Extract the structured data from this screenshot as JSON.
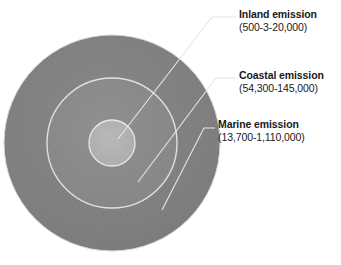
{
  "chart_data": {
    "type": "pie",
    "title": "",
    "subtitle": "",
    "xlabel": "",
    "ylabel": "",
    "legend_position": "right",
    "grid": false,
    "layout": "concentric-circles",
    "categories": [
      "Inland emission",
      "Coastal emission",
      "Marine emission"
    ],
    "annotations": [
      "Inland emission (500-3-20,000)",
      "Coastal emission (54,300-145,000)",
      "Marine emission (13,700-1,110,000)"
    ],
    "series": [
      {
        "name": "emission range",
        "values": [
          {
            "category": "Inland emission",
            "range_text": "(500-3-20,000)",
            "low": 500,
            "high": 20000,
            "radius_px": 23
          },
          {
            "category": "Coastal emission",
            "range_text": "(54,300-145,000)",
            "low": 54300,
            "high": 145000,
            "radius_px": 65
          },
          {
            "category": "Marine emission",
            "range_text": "(13,700-1,110,000)",
            "low": 13700,
            "high": 1110000,
            "radius_px": 108
          }
        ]
      }
    ]
  },
  "figure": {
    "center": {
      "x": 112,
      "y": 143
    },
    "rings": [
      {
        "id": "marine",
        "name": "Marine emission",
        "radius": 108,
        "fill": "#7f7f7f",
        "stroke": "#d9d9d9"
      },
      {
        "id": "coastal",
        "name": "Coastal emission",
        "radius": 65,
        "fill": "#878787",
        "stroke": "#e0e0e0"
      },
      {
        "id": "inland",
        "name": "Inland emission",
        "radius": 23,
        "fill": "#b0b0b0",
        "stroke": "#e8e8e8"
      }
    ],
    "leader_line_color": "#e6e6e6"
  },
  "labels": {
    "inland": {
      "title": "Inland emission",
      "range": "(500-3-20,000)"
    },
    "coastal": {
      "title": "Coastal emission",
      "range": "(54,300-145,000)"
    },
    "marine": {
      "title": "Marine emission",
      "range": "(13,700-1,110,000)"
    }
  },
  "colors": {
    "outer_ring": "#7f7f7f",
    "middle_ring": "#878787",
    "inner_circle": "#b0b0b0",
    "ring_stroke": "#dedede",
    "leader_line": "#e6e6e6",
    "text": "#1a1a1a",
    "background": "#ffffff"
  }
}
